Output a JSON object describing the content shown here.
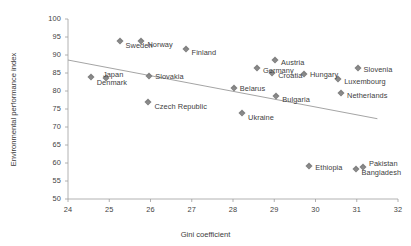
{
  "chart_data": {
    "type": "scatter",
    "title": "",
    "xlabel": "Gini coefficient",
    "ylabel": "Environmental performance index",
    "xlim": [
      24,
      32
    ],
    "ylim": [
      50,
      100
    ],
    "xticks": [
      "24",
      "25",
      "26",
      "27",
      "28",
      "29",
      "30",
      "31",
      "32"
    ],
    "yticks": [
      "50",
      "55",
      "60",
      "65",
      "70",
      "75",
      "80",
      "85",
      "90",
      "95",
      "100"
    ],
    "grid": false,
    "legend": "none",
    "marker_color": "#808080",
    "marker_shape": "diamond",
    "trendline": {
      "present": true,
      "color": "#9a9a9a",
      "x_start": 24.0,
      "y_start": 88.6,
      "x_end": 31.5,
      "y_end": 72.3
    },
    "points": [
      {
        "label": "Denmark",
        "x": 24.55,
        "y": 84.0,
        "label_dx": 6,
        "label_dy": 5
      },
      {
        "label": "Japan",
        "x": 24.92,
        "y": 83.7,
        "label_dx": -3,
        "label_dy": -4
      },
      {
        "label": "Sweden",
        "x": 25.25,
        "y": 93.9,
        "label_dx": 6,
        "label_dy": 4
      },
      {
        "label": "Norway",
        "x": 25.78,
        "y": 93.9,
        "label_dx": 6,
        "label_dy": 3
      },
      {
        "label": "Slovakia",
        "x": 25.97,
        "y": 84.2,
        "label_dx": 6,
        "label_dy": 0
      },
      {
        "label": "Czech Republic",
        "x": 25.95,
        "y": 77.0,
        "label_dx": 6,
        "label_dy": 4
      },
      {
        "label": "Finland",
        "x": 26.85,
        "y": 91.8,
        "label_dx": 6,
        "label_dy": 3
      },
      {
        "label": "Belarus",
        "x": 28.02,
        "y": 80.8,
        "label_dx": 6,
        "label_dy": 0
      },
      {
        "label": "Ukraine",
        "x": 28.22,
        "y": 74.0,
        "label_dx": 6,
        "label_dy": 4
      },
      {
        "label": "Germany",
        "x": 28.58,
        "y": 86.4,
        "label_dx": 6,
        "label_dy": 2
      },
      {
        "label": "Austria",
        "x": 29.02,
        "y": 88.6,
        "label_dx": 6,
        "label_dy": 2
      },
      {
        "label": "Croatia",
        "x": 28.95,
        "y": 85.0,
        "label_dx": 6,
        "label_dy": 2
      },
      {
        "label": "Bulgaria",
        "x": 29.05,
        "y": 78.6,
        "label_dx": 6,
        "label_dy": 3
      },
      {
        "label": "Hungary",
        "x": 29.72,
        "y": 84.6,
        "label_dx": 6,
        "label_dy": 0
      },
      {
        "label": "Ethiopia",
        "x": 29.85,
        "y": 59.2,
        "label_dx": 6,
        "label_dy": 1
      },
      {
        "label": "Slovenia",
        "x": 31.02,
        "y": 86.3,
        "label_dx": 6,
        "label_dy": 1
      },
      {
        "label": "Luxembourg",
        "x": 30.55,
        "y": 83.2,
        "label_dx": 6,
        "label_dy": 2
      },
      {
        "label": "Netherlands",
        "x": 30.62,
        "y": 79.4,
        "label_dx": 6,
        "label_dy": 2
      },
      {
        "label": "Bangladesh",
        "x": 30.97,
        "y": 58.3,
        "label_dx": 6,
        "label_dy": 3
      },
      {
        "label": "Pakistan",
        "x": 31.15,
        "y": 58.8,
        "label_dx": 6,
        "label_dy": -4
      }
    ]
  }
}
